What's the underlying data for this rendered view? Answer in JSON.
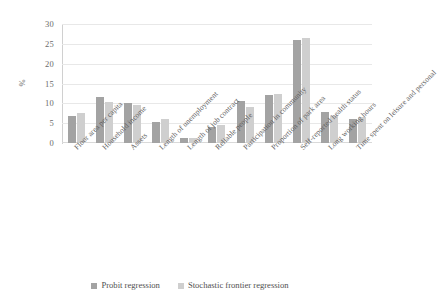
{
  "chart_data": {
    "type": "bar",
    "title": "",
    "subtitle": "",
    "xlabel": "",
    "ylabel": "%",
    "ylim": [
      0,
      30
    ],
    "yticks": [
      0,
      5,
      10,
      15,
      20,
      25,
      30
    ],
    "ytick_labels": [
      "0",
      "5",
      "10",
      "15",
      "20",
      "25",
      "30"
    ],
    "grid": true,
    "legend_position": "bottom",
    "categories": [
      "Floor area per capita",
      "Household income",
      "Assets",
      "Length of unemployment",
      "Length of job contract",
      "Reliable people",
      "Participation in community",
      "Proportion of park area",
      "Self-reported health status",
      "Long working hours",
      "Time spent on leisure and personal"
    ],
    "series": [
      {
        "name": "Probit regression",
        "color": "#a3a3a3",
        "values": [
          6.8,
          11.5,
          10.2,
          5.2,
          1.3,
          4.1,
          10.6,
          12.0,
          25.9,
          7.9,
          6.1
        ]
      },
      {
        "name": "Stochastic frontier regression",
        "color": "#cfcfcf",
        "values": [
          7.5,
          10.4,
          9.7,
          6.1,
          1.35,
          4.6,
          9.2,
          12.3,
          26.6,
          6.7,
          6.5
        ]
      }
    ]
  }
}
